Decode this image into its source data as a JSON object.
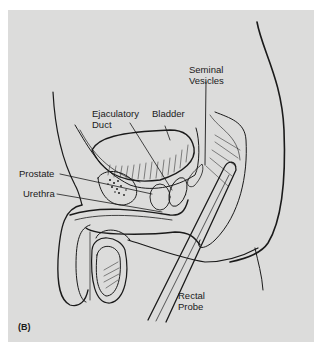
{
  "figure": {
    "panel_label": "(B)",
    "background_color": "#dcdcdb",
    "line_color": "#1a1a1a"
  },
  "labels": {
    "seminal_vesicles": [
      "Seminal",
      "Vesicles"
    ],
    "ejaculatory_duct": [
      "Ejaculatory",
      "Duct"
    ],
    "bladder": "Bladder",
    "prostate": "Prostate",
    "urethra": "Urethra",
    "rectal_probe": [
      "Rectal",
      "Probe"
    ]
  }
}
